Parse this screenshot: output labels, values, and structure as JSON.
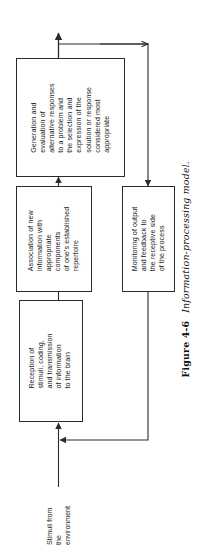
{
  "figure": {
    "caption_label": "Figure 4-6",
    "caption_title": "Information-processing model.",
    "input_label": "Stimuli from\nthe\nenvironment",
    "boxes": [
      {
        "id": "reception",
        "text": "Reception of\nstimuli, coding,\nand transmission\nof information\nto the brain"
      },
      {
        "id": "association",
        "text": "Association of new\ninformation with\nappropriate\ncomponents\nof one's established\nrepertoire"
      },
      {
        "id": "generation",
        "text": "Generation and\nevaluation of\nalternative responses\nto a problem and\nthe selection and\nexpression of the\nsolution or response\nconsidered most\nappropriate"
      },
      {
        "id": "monitoring",
        "text": "Monitoring of output\nand feedback to\nthe receptive side\nof the process"
      }
    ],
    "colors": {
      "ink": "#1a1a1a",
      "line": "#2b2b2b",
      "background": "#ffffff"
    }
  }
}
